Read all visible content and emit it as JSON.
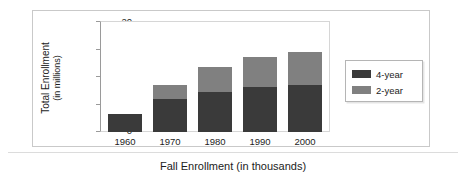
{
  "chart_data": {
    "type": "bar",
    "subtype": "stacked-bar",
    "title": "",
    "xlabel": "Fall Enrollment (in thousands)",
    "ylabel": "Total Enrollment (in millions)",
    "ylabel_line1": "Total Enrollment",
    "ylabel_line2": "(in millions)",
    "categories": [
      "1960",
      "1970",
      "1980",
      "1990",
      "2000"
    ],
    "series": [
      {
        "name": "4-year",
        "color": "#3a3a3a",
        "values": [
          3.3,
          5.9,
          7.2,
          8.2,
          8.5
        ]
      },
      {
        "name": "2-year",
        "color": "#808080",
        "values": [
          0.0,
          2.5,
          4.6,
          5.3,
          6.0
        ]
      }
    ],
    "totals": [
      3.3,
      8.4,
      11.8,
      13.5,
      14.5
    ],
    "ylim": [
      0,
      20
    ],
    "yticks": [
      0,
      5,
      10,
      15,
      20
    ],
    "ytick_labels": [
      "0",
      "5",
      "10",
      "15",
      "20"
    ],
    "grid": false,
    "legend_position": "right"
  },
  "legend": {
    "entries": [
      {
        "label": "4-year",
        "color": "#3a3a3a"
      },
      {
        "label": "2-year",
        "color": "#808080"
      }
    ]
  },
  "colors": {
    "four_year": "#3a3a3a",
    "two_year": "#808080",
    "frame": "#c9c9c9",
    "axis": "#9a9a9a",
    "text": "#1c1c1c",
    "background": "#ffffff"
  }
}
